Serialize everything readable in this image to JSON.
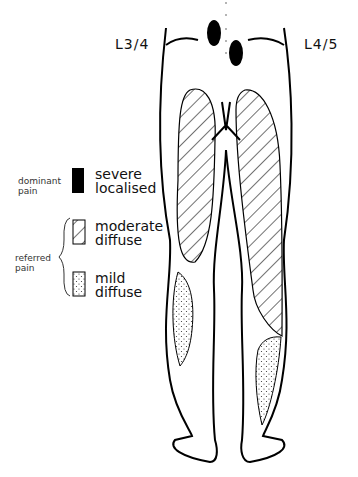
{
  "levels": {
    "left": "L3/4",
    "right": "L4/5"
  },
  "legend": {
    "dominant_group": "dominant pain",
    "dominant_line1": "dominant",
    "dominant_line2": "pain",
    "referred_line1": "referred",
    "referred_line2": "pain",
    "items": [
      {
        "pattern": "solid-black",
        "line1": "severe",
        "line2": "localised"
      },
      {
        "pattern": "diagonal-hatch",
        "line1": "moderate",
        "line2": "diffuse"
      },
      {
        "pattern": "dotted-stipple",
        "line1": "mild",
        "line2": "diffuse"
      }
    ]
  }
}
